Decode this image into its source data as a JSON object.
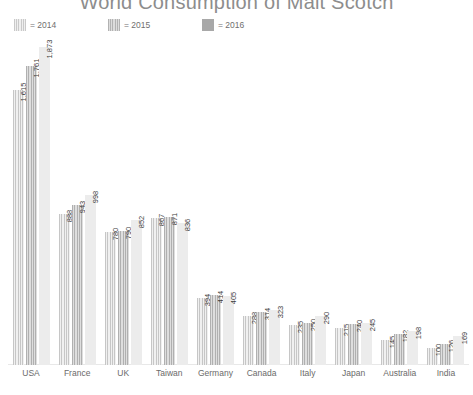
{
  "title": "World Consumption of Malt Scotch",
  "legend": [
    {
      "label": "= 2014",
      "key": "2014",
      "color": "#e6e6e6"
    },
    {
      "label": "= 2015",
      "key": "2015",
      "color": "#d0d0d0"
    },
    {
      "label": "= 2016",
      "key": "2016",
      "color": "#a8a8a8"
    }
  ],
  "chart_data": {
    "type": "bar",
    "title": "World Consumption of Malt Scotch",
    "xlabel": "",
    "ylabel": "",
    "grid": false,
    "legend_position": "top-left",
    "ylim": [
      0,
      1900
    ],
    "categories": [
      "USA",
      "France",
      "UK",
      "Taiwan",
      "Germany",
      "Canada",
      "Italy",
      "Japan",
      "Australia",
      "India"
    ],
    "series": [
      {
        "name": "2014",
        "values": [
          1615,
          888,
          780,
          867,
          394,
          288,
          235,
          215,
          145,
          100
        ]
      },
      {
        "name": "2015",
        "values": [
          1761,
          943,
          790,
          871,
          414,
          314,
          250,
          240,
          182,
          126
        ]
      },
      {
        "name": "2016",
        "values": [
          1873,
          998,
          852,
          836,
          405,
          323,
          290,
          245,
          198,
          169
        ]
      }
    ],
    "value_labels": [
      [
        "1,615",
        "1,761",
        "1,873"
      ],
      [
        "888",
        "943",
        "998"
      ],
      [
        "780",
        "790",
        "852"
      ],
      [
        "867",
        "871",
        "836"
      ],
      [
        "394",
        "414",
        "405"
      ],
      [
        "288",
        "314",
        "323"
      ],
      [
        "235",
        "250",
        "290"
      ],
      [
        "215",
        "240",
        "245"
      ],
      [
        "145",
        "182",
        "198"
      ],
      [
        "100",
        "126",
        "169"
      ]
    ]
  }
}
